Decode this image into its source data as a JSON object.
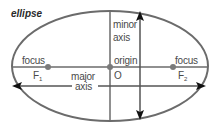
{
  "diagram": {
    "title": "ellipse",
    "labels": {
      "minor_axis_line1": "minor",
      "minor_axis_line2": "axis",
      "focus_left": "focus",
      "focus_right": "focus",
      "origin": "origin",
      "origin_point": "O",
      "f1": "F",
      "f1_sub": "1",
      "f2": "F",
      "f2_sub": "2",
      "major_axis_line1": "major",
      "major_axis_line2": "axis"
    },
    "colors": {
      "stroke": "#6b6b6b",
      "arrow": "#111111",
      "dot": "#7a7a7a",
      "text": "#4a4a4a"
    },
    "geometry": {
      "ellipse": {
        "cx": 110,
        "cy": 66,
        "rx": 98,
        "ry": 55
      },
      "foci": [
        {
          "name": "F1",
          "x": 48,
          "y": 67
        },
        {
          "name": "F2",
          "x": 173,
          "y": 67
        }
      ],
      "origin": {
        "x": 110,
        "y": 67
      }
    }
  }
}
